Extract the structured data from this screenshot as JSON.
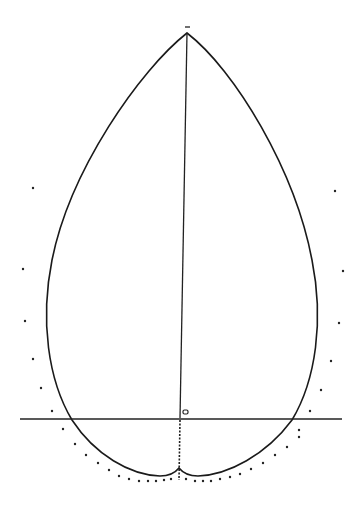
{
  "diagram": {
    "title": "",
    "colors": {
      "line": "#1a1a1a",
      "background": "#ffffff"
    },
    "apex": {
      "x": 187,
      "y": 33
    },
    "apex_tick": {
      "x": 187,
      "y": 27
    },
    "baseline": {
      "x1": 20,
      "y1": 419,
      "x2": 342,
      "y2": 419
    },
    "axis": {
      "x1": 187,
      "y1": 33,
      "x2": 180,
      "y2": 418
    },
    "axis_dashed": {
      "x1": 180,
      "y1": 420,
      "x2": 179,
      "y2": 480
    },
    "center_marker": {
      "x": 183,
      "y": 410,
      "label": "o"
    },
    "outline_path": "M187,33 C140,70 70,170 52,260 C40,320 48,380 72,420 C95,455 130,475 160,476 C170,476 175,473 179,468 C183,473 188,476 198,476 C228,475 266,455 292,420 C316,380 324,320 312,260 C295,170 235,70 187,33 Z",
    "envelope_dots": [
      {
        "x": 33,
        "y": 188
      },
      {
        "x": 23,
        "y": 269
      },
      {
        "x": 25,
        "y": 321
      },
      {
        "x": 33,
        "y": 359
      },
      {
        "x": 41,
        "y": 388
      },
      {
        "x": 52,
        "y": 411
      },
      {
        "x": 63,
        "y": 429
      },
      {
        "x": 75,
        "y": 444
      },
      {
        "x": 86,
        "y": 455
      },
      {
        "x": 98,
        "y": 463
      },
      {
        "x": 109,
        "y": 470
      },
      {
        "x": 119,
        "y": 476
      },
      {
        "x": 129,
        "y": 479
      },
      {
        "x": 139,
        "y": 481
      },
      {
        "x": 148,
        "y": 481
      },
      {
        "x": 156,
        "y": 481
      },
      {
        "x": 164,
        "y": 480
      },
      {
        "x": 171,
        "y": 479
      },
      {
        "x": 186,
        "y": 479
      },
      {
        "x": 195,
        "y": 481
      },
      {
        "x": 203,
        "y": 481
      },
      {
        "x": 211,
        "y": 481
      },
      {
        "x": 220,
        "y": 479
      },
      {
        "x": 230,
        "y": 477
      },
      {
        "x": 240,
        "y": 474
      },
      {
        "x": 251,
        "y": 469
      },
      {
        "x": 263,
        "y": 463
      },
      {
        "x": 275,
        "y": 455
      },
      {
        "x": 287,
        "y": 447
      },
      {
        "x": 299,
        "y": 437
      },
      {
        "x": 310,
        "y": 411
      },
      {
        "x": 321,
        "y": 390
      },
      {
        "x": 331,
        "y": 361
      },
      {
        "x": 339,
        "y": 323
      },
      {
        "x": 343,
        "y": 271
      },
      {
        "x": 335,
        "y": 191
      },
      {
        "x": 299,
        "y": 430
      }
    ]
  }
}
